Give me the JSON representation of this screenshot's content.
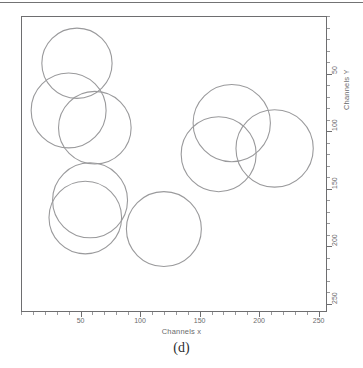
{
  "figure": {
    "caption": "(d)",
    "background_color": "#ffffff",
    "frame_color": "#6e6e70",
    "circle_color": "#9a9a9c"
  },
  "chart_data": {
    "type": "scatter",
    "title": "",
    "subtitle": "",
    "xlabel": "Channels x",
    "ylabel": "Channels Y",
    "xlim": [
      0,
      257
    ],
    "ylim": [
      0,
      257
    ],
    "x_ticks": [
      50,
      100,
      150,
      200,
      250
    ],
    "x_tick_labels": [
      "50",
      "100",
      "150",
      "200",
      "250"
    ],
    "y_ticks": [
      50,
      100,
      150,
      200,
      250
    ],
    "y_tick_labels": [
      "50",
      "100",
      "150",
      "200",
      "250"
    ],
    "x_minor_tick_step": 10,
    "y_minor_tick_step": 10,
    "grid": false,
    "legend": false,
    "legend_position": "none",
    "marker_shape": "circle-outline",
    "series": [
      {
        "name": "detected circles",
        "count": 8,
        "circles": [
          {
            "id": 1,
            "cx": 47,
            "cy": 41,
            "r": 30
          },
          {
            "id": 2,
            "cx": 40,
            "cy": 82,
            "r": 32
          },
          {
            "id": 3,
            "cx": 62,
            "cy": 97,
            "r": 31
          },
          {
            "id": 4,
            "cx": 58,
            "cy": 160,
            "r": 32
          },
          {
            "id": 5,
            "cx": 54,
            "cy": 175,
            "r": 31
          },
          {
            "id": 6,
            "cx": 120,
            "cy": 185,
            "r": 32
          },
          {
            "id": 7,
            "cx": 177,
            "cy": 93,
            "r": 33
          },
          {
            "id": 8,
            "cx": 166,
            "cy": 120,
            "r": 32
          },
          {
            "id": 9,
            "cx": 213,
            "cy": 115,
            "r": 33
          }
        ]
      }
    ],
    "annotations": []
  }
}
